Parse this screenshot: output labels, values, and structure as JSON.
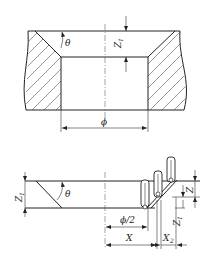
{
  "figure_top": {
    "title": "Countersunk bore cross-section",
    "labels": {
      "angle": "θ",
      "depth_main": "Z",
      "depth_sub": "1",
      "diameter": "ϕ"
    }
  },
  "figure_bottom": {
    "title": "Chamfer tool path",
    "labels": {
      "angle": "θ",
      "depth_left_main": "Z",
      "depth_left_sub": "1",
      "step_z": "Z",
      "depth_right_main": "Z",
      "depth_right_sub": "1",
      "half_diameter": "ϕ/2",
      "x_offset": "X",
      "x2_main": "X",
      "x2_sub": "2"
    },
    "tool_positions": 3
  }
}
